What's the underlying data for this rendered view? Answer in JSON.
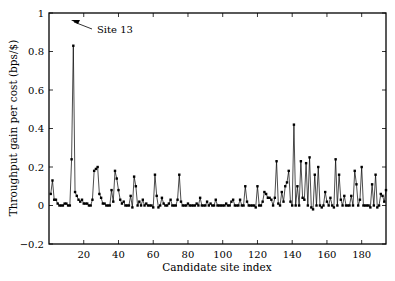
{
  "chart_data": {
    "type": "line",
    "title": "",
    "xlabel": "Candidate site index",
    "ylabel": "Throughput gain per cost (bps/$)",
    "xlim": [
      0,
      194
    ],
    "ylim": [
      -0.2,
      1
    ],
    "xticks": [
      20,
      40,
      60,
      80,
      100,
      120,
      140,
      160,
      180
    ],
    "yticks": [
      -0.2,
      0,
      0.2,
      0.4,
      0.6,
      0.8,
      1
    ],
    "ytick_labels": [
      "−0.2",
      "0",
      "0.2",
      "0.4",
      "0.6",
      "0.8",
      "1"
    ],
    "grid": false,
    "annotations": [
      {
        "text": "Site 13",
        "x": 13,
        "y": 0.83
      }
    ],
    "series": [
      {
        "name": "gain",
        "x_start": 1,
        "values": [
          0.06,
          0.13,
          0.03,
          0.03,
          0.01,
          0.0,
          0.0,
          0.0,
          0.01,
          0.01,
          0.0,
          0.0,
          0.24,
          0.83,
          0.07,
          0.05,
          0.03,
          0.02,
          0.03,
          0.01,
          0.01,
          0.01,
          0.0,
          0.0,
          0.03,
          0.18,
          0.19,
          0.2,
          0.06,
          0.04,
          0.01,
          0.01,
          0.0,
          0.0,
          0.0,
          0.08,
          0.02,
          0.18,
          0.14,
          0.08,
          0.03,
          0.01,
          0.02,
          0.0,
          0.0,
          0.0,
          0.05,
          -0.01,
          0.15,
          0.1,
          0.0,
          0.02,
          0.0,
          0.03,
          0.0,
          0.01,
          0.0,
          0.0,
          0.0,
          -0.01,
          0.16,
          0.05,
          -0.01,
          0.0,
          0.04,
          0.01,
          0.0,
          0.0,
          0.01,
          0.03,
          0.0,
          0.0,
          0.0,
          0.03,
          0.16,
          0.02,
          0.0,
          0.0,
          0.0,
          0.01,
          0.0,
          0.0,
          0.0,
          0.0,
          0.01,
          0.0,
          0.04,
          0.0,
          0.0,
          0.0,
          0.02,
          0.0,
          0.01,
          0.0,
          0.0,
          0.03,
          0.0,
          0.0,
          0.0,
          0.0,
          0.0,
          0.01,
          0.0,
          0.0,
          0.02,
          0.03,
          0.0,
          0.0,
          0.0,
          0.03,
          0.0,
          0.0,
          0.1,
          0.02,
          0.0,
          0.0,
          0.0,
          0.0,
          -0.01,
          0.1,
          0.0,
          0.0,
          0.02,
          0.07,
          0.06,
          0.04,
          0.04,
          0.03,
          0.0,
          0.04,
          0.23,
          0.01,
          0.0,
          0.07,
          0.02,
          0.1,
          0.12,
          0.18,
          0.02,
          0.0,
          0.42,
          0.0,
          0.1,
          0.0,
          0.23,
          0.04,
          0.03,
          0.22,
          0.0,
          0.25,
          -0.01,
          -0.02,
          0.16,
          0.0,
          0.2,
          0.0,
          -0.01,
          0.0,
          0.07,
          0.02,
          0.0,
          0.04,
          0.0,
          -0.01,
          0.24,
          0.0,
          0.16,
          0.03,
          0.0,
          0.05,
          0.0,
          0.0,
          0.0,
          0.05,
          0.0,
          0.18,
          0.11,
          0.0,
          0.03,
          0.2,
          0.0,
          0.0,
          0.0,
          0.0,
          -0.01,
          0.11,
          0.0,
          0.16,
          -0.01,
          0.0,
          0.06,
          0.05,
          0.02,
          0.08
        ]
      }
    ]
  }
}
